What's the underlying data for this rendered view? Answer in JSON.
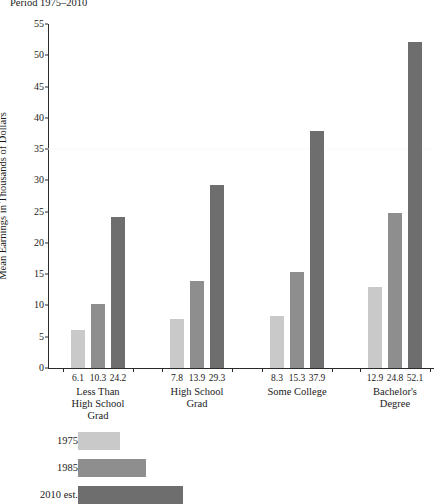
{
  "chart_data": {
    "type": "bar",
    "title": "Period 1975–2010",
    "xlabel": "",
    "ylabel": "Mean Earnings in Thousands of Dollars",
    "ylim": [
      0,
      55
    ],
    "yticks": [
      0,
      5,
      10,
      15,
      20,
      25,
      30,
      35,
      40,
      45,
      50,
      55
    ],
    "ytick_labels": [
      "0",
      "5",
      "10",
      "15",
      "20",
      "25",
      "30",
      "35",
      "40",
      "45",
      "50",
      "55"
    ],
    "grid": "faint-horizontal-at-35",
    "legend_position": "below-left",
    "categories": [
      "Less Than\nHigh School\nGrad",
      "High School\nGrad",
      "Some College",
      "Bachelor's Degree"
    ],
    "series": [
      {
        "name": "1975",
        "color": "#c9c9c9",
        "values": [
          6.1,
          7.8,
          8.3,
          12.9
        ],
        "value_labels": [
          "6.1",
          "7.8",
          "8.3",
          "12.9"
        ]
      },
      {
        "name": "1985",
        "color": "#8e8e8e",
        "values": [
          10.3,
          13.9,
          15.3,
          24.8
        ],
        "value_labels": [
          "10.3",
          "13.9",
          "15.3",
          "24.8"
        ]
      },
      {
        "name": "2010 est.",
        "color": "#6e6e6e",
        "values": [
          24.2,
          29.3,
          37.9,
          52.1
        ],
        "value_labels": [
          "24.2",
          "29.3",
          "37.9",
          "52.1"
        ]
      }
    ]
  },
  "legend": {
    "items": [
      {
        "label": "1975",
        "color": "#c9c9c9",
        "swatch_width": 42
      },
      {
        "label": "1985",
        "color": "#8e8e8e",
        "swatch_width": 68
      },
      {
        "label": "2010 est.",
        "color": "#6e6e6e",
        "swatch_width": 105
      }
    ]
  },
  "colors": {
    "axis": "#2b2b2b",
    "text": "#1a1a1a",
    "background": "#ffffff",
    "gridline": "#fafafa"
  }
}
